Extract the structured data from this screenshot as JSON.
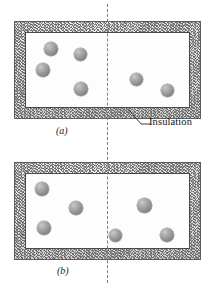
{
  "figure": {
    "name": "insulated-rigid-tank-free-expansion",
    "background_color": "#ffffff",
    "width": 214,
    "height": 286
  },
  "colors": {
    "insulation_fill": "#d8d8d8",
    "insulation_stroke": "#5d5d5d",
    "chamber_fill": "#fdfdfd",
    "chamber_stroke": "#4a4a4a",
    "molecule_fill": "#9a9a9a",
    "partition_stroke": "#7d7d7d",
    "text_color": "#111111"
  },
  "annotations": {
    "insulation_label": "Insulation",
    "insulation_icon": "hatched-insulation-texture",
    "leader_icon": "leader-line"
  },
  "panels": [
    {
      "id": "a",
      "caption": "(a)",
      "caption_x": 56,
      "caption_y": 125,
      "outer": {
        "x": 14,
        "y": 21,
        "width": 187,
        "height": 98
      },
      "interior": {
        "x": 25,
        "y": 32,
        "width": 165,
        "height": 76
      },
      "wall_thickness": 11,
      "partition": {
        "x": 107,
        "y_top": 4,
        "y_bottom": 140
      },
      "molecules": [
        {
          "x": 44,
          "y": 42,
          "d": 14,
          "side": "left"
        },
        {
          "x": 74,
          "y": 48,
          "d": 13,
          "side": "left"
        },
        {
          "x": 36,
          "y": 63,
          "d": 14,
          "side": "left"
        },
        {
          "x": 74,
          "y": 82,
          "d": 14,
          "side": "left"
        },
        {
          "x": 130,
          "y": 73,
          "d": 13,
          "side": "right"
        },
        {
          "x": 161,
          "y": 84,
          "d": 13,
          "side": "right"
        }
      ],
      "molecule_count_left": 4,
      "molecule_count_right": 2
    },
    {
      "id": "b",
      "caption": "(b)",
      "caption_x": 57,
      "caption_y": 265,
      "outer": {
        "x": 14,
        "y": 162,
        "width": 187,
        "height": 98
      },
      "interior": {
        "x": 25,
        "y": 173,
        "width": 165,
        "height": 76
      },
      "wall_thickness": 11,
      "partition": {
        "x": 107,
        "y_top": 142,
        "y_bottom": 283
      },
      "molecules": [
        {
          "x": 35,
          "y": 182,
          "d": 14,
          "side": "left"
        },
        {
          "x": 69,
          "y": 201,
          "d": 14,
          "side": "left"
        },
        {
          "x": 37,
          "y": 221,
          "d": 14,
          "side": "left"
        },
        {
          "x": 137,
          "y": 198,
          "d": 15,
          "side": "right"
        },
        {
          "x": 109,
          "y": 229,
          "d": 13,
          "side": "right"
        },
        {
          "x": 160,
          "y": 228,
          "d": 14,
          "side": "right"
        }
      ],
      "molecule_count_left": 3,
      "molecule_count_right": 3
    }
  ],
  "insulation_callout": {
    "label": "Insulation",
    "text_x": 145,
    "text_y": 122,
    "leader": {
      "x1": 141,
      "y1": 124,
      "x2": 129,
      "y2": 110
    }
  }
}
